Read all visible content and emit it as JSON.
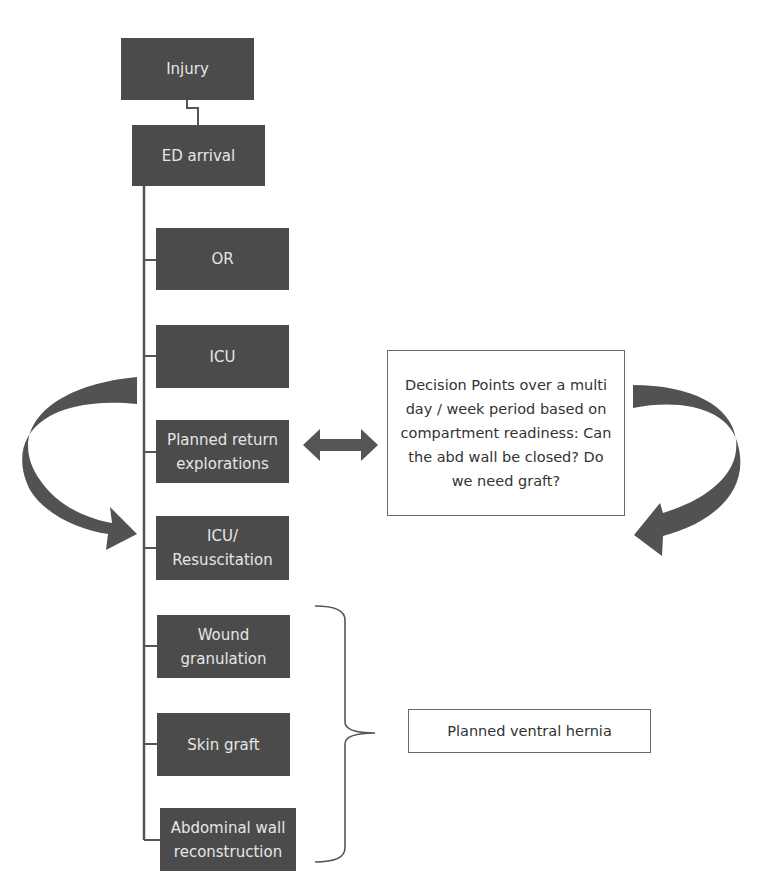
{
  "flowchart": {
    "nodes": [
      {
        "id": "injury",
        "label": "Injury"
      },
      {
        "id": "ed",
        "label": "ED arrival"
      },
      {
        "id": "or",
        "label": "OR"
      },
      {
        "id": "icu",
        "label": "ICU"
      },
      {
        "id": "planned_return",
        "label": "Planned return explorations"
      },
      {
        "id": "icu_resus",
        "label": "ICU/ Resuscitation"
      },
      {
        "id": "wound",
        "label": "Wound granulation"
      },
      {
        "id": "skin_graft",
        "label": "Skin graft"
      },
      {
        "id": "awr",
        "label": "Abdominal wall reconstruction"
      }
    ],
    "decision_note": "Decision Points over a multi day / week period based on compartment readiness:  Can the abd wall be closed? Do we need graft?",
    "hernia_note": "Planned ventral hernia"
  },
  "colors": {
    "node_fill": "#4b4b4b",
    "node_text": "#e6e6e6",
    "line": "#555555",
    "note_border": "#6a6a6a"
  }
}
